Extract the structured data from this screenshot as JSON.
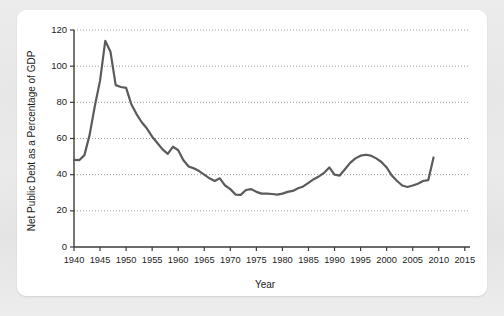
{
  "chart_data": {
    "type": "line",
    "title": "",
    "xlabel": "Year",
    "ylabel": "Net Public Debt as a Percentage of GDP",
    "xlim": [
      1940,
      2016
    ],
    "ylim": [
      0,
      120
    ],
    "xticks": [
      1940,
      1945,
      1950,
      1955,
      1960,
      1965,
      1970,
      1975,
      1980,
      1985,
      1990,
      1995,
      2000,
      2005,
      2010,
      2015
    ],
    "yticks": [
      0,
      20,
      40,
      60,
      80,
      100,
      120
    ],
    "xtick_labels": [
      "1940",
      "1945",
      "1950",
      "1955",
      "1960",
      "1965",
      "1970",
      "1975",
      "1980",
      "1985",
      "1990",
      "1995",
      "2000",
      "2005",
      "2010",
      "2015"
    ],
    "ytick_labels": [
      "0",
      "20",
      "40",
      "60",
      "80",
      "100",
      "120"
    ],
    "grid": "horizontal-dotted",
    "legend": "none",
    "line_color": "#5b5b5b",
    "axis_color": "#3b3b3b",
    "grid_color": "#9b9b9b",
    "series": [
      {
        "name": "Net Public Debt as a Percentage of GDP",
        "x": [
          1940,
          1941,
          1942,
          1943,
          1944,
          1945,
          1946,
          1947,
          1948,
          1949,
          1950,
          1951,
          1952,
          1953,
          1954,
          1955,
          1956,
          1957,
          1958,
          1959,
          1960,
          1961,
          1962,
          1963,
          1964,
          1965,
          1966,
          1967,
          1968,
          1969,
          1970,
          1971,
          1972,
          1973,
          1974,
          1975,
          1976,
          1977,
          1978,
          1979,
          1980,
          1981,
          1982,
          1983,
          1984,
          1985,
          1986,
          1987,
          1988,
          1989,
          1990,
          1991,
          1992,
          1993,
          1994,
          1995,
          1996,
          1997,
          1998,
          1999,
          2000,
          2001,
          2002,
          2003,
          2004,
          2005,
          2006,
          2007,
          2008,
          2009
        ],
        "values": [
          48.2,
          48.0,
          50.8,
          62.0,
          78.0,
          92.0,
          114.0,
          108.0,
          89.5,
          88.5,
          88.0,
          79.0,
          73.5,
          69.0,
          65.5,
          61.0,
          57.5,
          54.0,
          51.5,
          55.5,
          53.5,
          48.0,
          44.5,
          43.5,
          42.0,
          40.0,
          38.0,
          36.5,
          38.0,
          34.0,
          32.0,
          29.0,
          28.8,
          31.5,
          32.0,
          30.5,
          29.5,
          29.5,
          29.3,
          29.0,
          29.5,
          30.5,
          31.0,
          32.5,
          33.5,
          35.5,
          37.5,
          39.0,
          41.0,
          44.0,
          40.0,
          39.5,
          43.0,
          46.5,
          49.0,
          50.5,
          51.0,
          50.5,
          49.0,
          47.0,
          44.0,
          39.5,
          36.5,
          34.0,
          33.2,
          34.0,
          35.0,
          36.5,
          37.0,
          49.5
        ]
      }
    ]
  },
  "figure": {
    "background_color": "#e9e9e9",
    "card_color": "#ffffff"
  }
}
